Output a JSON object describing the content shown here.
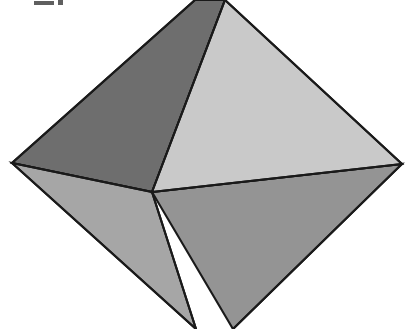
{
  "figure": {
    "title": "Octahedron",
    "shape_name": "octahedron",
    "background_color": "#ffffff",
    "edge_color": "#1a1a1a",
    "edge_width": 2.1,
    "canvas": {
      "width": 407,
      "height": 329
    },
    "artifact": {
      "name": "cropped-label-mark",
      "description": "partial dark mark cropped at top-left edge"
    },
    "vertices": {
      "top_apex_left_edge": [
        195,
        0
      ],
      "top_apex_right_edge": [
        225,
        0
      ],
      "left": [
        12,
        163
      ],
      "right": [
        402,
        164
      ],
      "center_front": [
        152,
        192
      ],
      "bottom_left_edge": [
        196,
        329
      ],
      "bottom_right_edge": [
        233,
        329
      ]
    },
    "faces": [
      {
        "name": "upper-left-face",
        "color": "#6e6e6e",
        "points": "195,0 12,163 152,192 225,0"
      },
      {
        "name": "upper-right-face",
        "color": "#c9c9c9",
        "points": "225,0 152,192 402,164"
      },
      {
        "name": "left-sliver-face",
        "color": "#b0b0b0",
        "points": "12,163 152,192 196,329"
      },
      {
        "name": "lower-left-face",
        "color": "#a6a6a6",
        "points": "12,163 196,329 152,192"
      },
      {
        "name": "lower-right-face",
        "color": "#949494",
        "points": "152,192 233,329 402,164"
      }
    ]
  }
}
